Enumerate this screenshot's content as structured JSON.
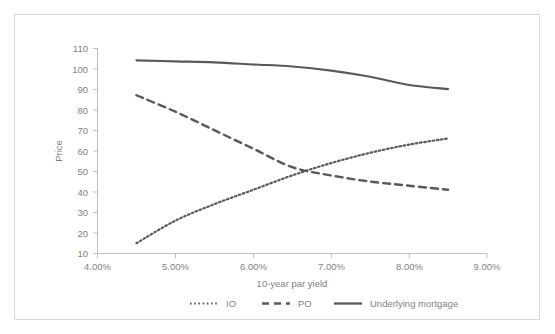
{
  "chart_data": {
    "type": "line",
    "title": "",
    "xlabel": "10-year par yield",
    "ylabel": "Price",
    "xlim": [
      4.0,
      9.0
    ],
    "ylim": [
      10,
      110
    ],
    "xticks": [
      "4.00%",
      "5.00%",
      "6.00%",
      "7.00%",
      "8.00%",
      "9.00%"
    ],
    "xtick_values": [
      4.0,
      5.0,
      6.0,
      7.0,
      8.0,
      9.0
    ],
    "yticks": [
      "10",
      "20",
      "30",
      "40",
      "50",
      "60",
      "70",
      "80",
      "90",
      "100",
      "110"
    ],
    "ytick_values": [
      10,
      20,
      30,
      40,
      50,
      60,
      70,
      80,
      90,
      100,
      110
    ],
    "grid": false,
    "legend_position": "bottom",
    "x": [
      4.5,
      5.0,
      5.5,
      6.0,
      6.5,
      7.0,
      7.5,
      8.0,
      8.5
    ],
    "series": [
      {
        "name": "IO",
        "style": "dotted",
        "color": "#595959",
        "values": [
          15,
          26,
          34,
          41,
          48,
          54,
          59,
          63,
          66
        ]
      },
      {
        "name": "PO",
        "style": "dashed",
        "color": "#595959",
        "values": [
          87,
          79,
          70,
          61,
          52,
          48,
          45,
          43,
          41
        ]
      },
      {
        "name": "Underlying mortgage",
        "style": "solid",
        "color": "#595959",
        "values": [
          104,
          103.5,
          103,
          102,
          101,
          99,
          96,
          92,
          90
        ]
      }
    ]
  },
  "legend": {
    "items": [
      {
        "label": "IO",
        "marker": "dotted-line-marker"
      },
      {
        "label": "PO",
        "marker": "dashed-line-marker"
      },
      {
        "label": "Underlying mortgage",
        "marker": "solid-line-marker"
      }
    ]
  },
  "colors": {
    "series": "#595959",
    "axis": "#bfbfbf",
    "text": "#7f7f7f",
    "frame": "#d9d9d9",
    "background": "#ffffff"
  }
}
